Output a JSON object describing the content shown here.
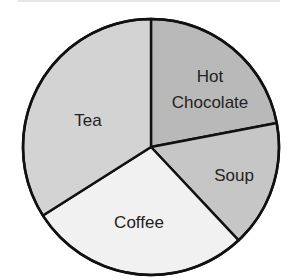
{
  "chart_data": {
    "type": "pie",
    "title": "",
    "unit": "percent (estimated from slice angles)",
    "start_angle_deg": -90,
    "direction": "clockwise",
    "legend": "none (labels inside slices)",
    "categories": [
      "Hot Chocolate",
      "Soup",
      "Coffee",
      "Tea"
    ],
    "values": [
      22,
      16,
      28,
      34
    ],
    "slices": [
      {
        "label": "Hot Chocolate",
        "label_lines": [
          "Hot",
          "Chocolate"
        ],
        "value": 22,
        "color": "#b9b9b9",
        "label_pos": [
          210,
          89
        ]
      },
      {
        "label": "Soup",
        "label_lines": [
          "Soup"
        ],
        "value": 16,
        "color": "#c6c6c6",
        "label_pos": [
          234,
          175
        ]
      },
      {
        "label": "Coffee",
        "label_lines": [
          "Coffee"
        ],
        "value": 28,
        "color": "#f1f1f1",
        "label_pos": [
          139,
          222
        ]
      },
      {
        "label": "Tea",
        "label_lines": [
          "Tea"
        ],
        "value": 34,
        "color": "#d3d3d3",
        "label_pos": [
          88,
          120
        ]
      }
    ]
  },
  "geometry": {
    "cx": 151,
    "cy": 147,
    "r": 128
  }
}
